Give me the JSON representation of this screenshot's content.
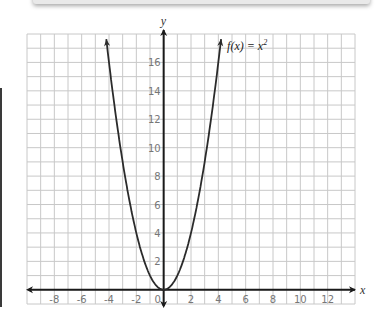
{
  "chart_data": {
    "type": "line",
    "title": "",
    "function_label": "f(x) = x²",
    "function_label_parts": {
      "prefix": "f(x) = x",
      "superscript": "2"
    },
    "xlabel": "x",
    "ylabel": "y",
    "xlim": [
      -10,
      14
    ],
    "ylim": [
      -1,
      18
    ],
    "grid": true,
    "grid_step": 1,
    "x_ticks": [
      -8,
      -6,
      -4,
      -2,
      0,
      2,
      4,
      6,
      8,
      10,
      12
    ],
    "y_ticks": [
      2,
      4,
      6,
      8,
      10,
      12,
      14,
      16
    ],
    "series": [
      {
        "name": "f(x) = x^2",
        "x": [
          -4.2,
          -4,
          -3,
          -2,
          -1,
          0,
          1,
          2,
          3,
          4,
          4.2
        ],
        "y": [
          17.64,
          16,
          9,
          4,
          1,
          0,
          1,
          4,
          9,
          16,
          17.64
        ]
      }
    ],
    "colors": {
      "curve": "#2b2b2b",
      "axis": "#1a1a1a",
      "grid": "#c8c8c8"
    }
  }
}
